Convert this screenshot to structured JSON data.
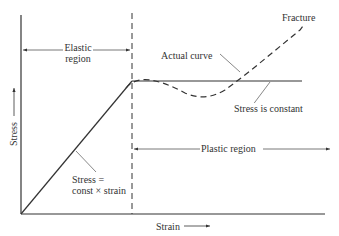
{
  "diagram": {
    "type": "stress-strain curve",
    "axes": {
      "x_label": "Strain",
      "y_label": "Stress"
    },
    "regions": {
      "elastic": {
        "line1": "Elastic",
        "line2": "region"
      },
      "plastic": {
        "label": "Plastic region"
      }
    },
    "annotations": {
      "actual_curve": "Actual curve",
      "fracture": "Fracture",
      "stress_constant": "Stress is constant",
      "linear_law_line1": "Stress =",
      "linear_law_line2": "const × strain"
    },
    "colors": {
      "line": "#2a2a2a",
      "background": "#ffffff"
    }
  }
}
